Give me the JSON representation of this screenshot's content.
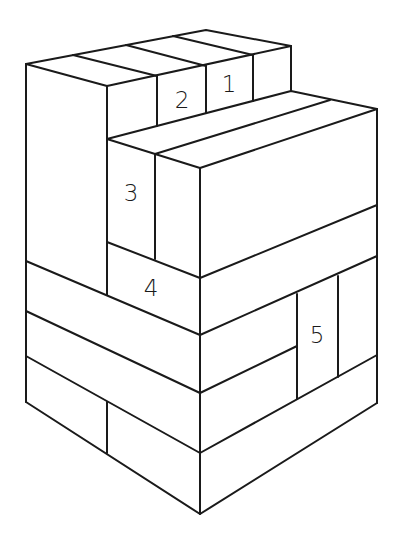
{
  "diagram": {
    "type": "isometric stacked blocks",
    "stroke_color": "#1a1a1a",
    "background": "#ffffff",
    "labels": [
      {
        "id": "block-1",
        "text": "1",
        "x": 229,
        "y": 84
      },
      {
        "id": "block-2",
        "text": "2",
        "x": 182,
        "y": 100
      },
      {
        "id": "block-3",
        "text": "3",
        "x": 131,
        "y": 193
      },
      {
        "id": "block-4",
        "text": "4",
        "x": 151,
        "y": 288
      },
      {
        "id": "block-5",
        "text": "5",
        "x": 317,
        "y": 335
      }
    ]
  }
}
